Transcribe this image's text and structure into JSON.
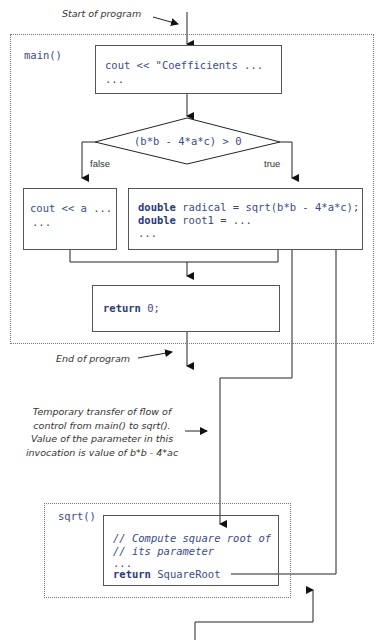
{
  "annotations": {
    "start": "Start of program",
    "end": "End of program",
    "transfer": [
      "Temporary transfer of flow of",
      "control  from main() to sqrt().",
      "Value of the parameter in this",
      "invocation is  value of b*b - 4*ac"
    ]
  },
  "main_frame": {
    "label": "main()",
    "blocks": {
      "cout_block": {
        "line1": "cout << \"Coefficients ...",
        "line2": "..."
      },
      "condition": "(b*b - 4*a*c) > 0",
      "false_label": "false",
      "true_label": "true",
      "false_block": {
        "line1": "cout << a ...",
        "line2": "..."
      },
      "true_block": {
        "line1_kw": "double",
        "line1_rest": " radical = sqrt(b*b - 4*a*c);",
        "line2_kw": "double",
        "line2_rest": " root1 = ...",
        "line3": "..."
      },
      "return_block": {
        "kw": "return",
        "rest": " 0;"
      }
    }
  },
  "sqrt_frame": {
    "label": "sqrt()",
    "block": {
      "comment1": "// Compute square root of",
      "comment2": "// its parameter",
      "dots": "...",
      "kw": "return",
      "rest": " SquareRoot"
    }
  }
}
